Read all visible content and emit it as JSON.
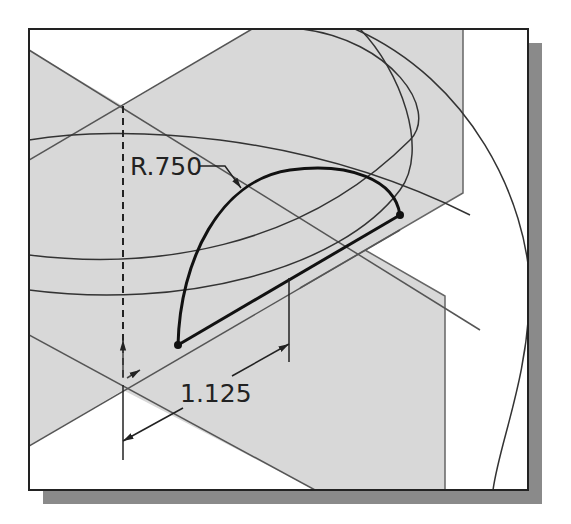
{
  "figure": {
    "type": "cad-sketch-diagram",
    "dimensions": [
      {
        "id": "radius",
        "label": "R.750"
      },
      {
        "id": "linear",
        "label": "1.125"
      }
    ]
  },
  "colors": {
    "plane_fill": "#d8d8d8",
    "background": "#ffffff",
    "frame": "#222222",
    "shadow": "#8a8a8a",
    "sketch_line": "#111111",
    "construction_line": "#555555"
  }
}
